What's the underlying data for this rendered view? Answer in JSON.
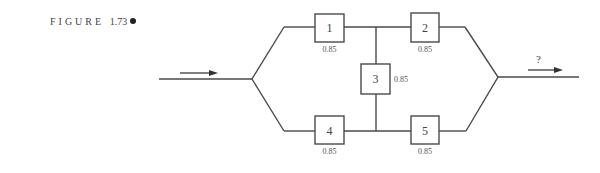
{
  "figure": {
    "label": "FIGURE",
    "number": "1.73",
    "marker": "bullet"
  },
  "diagram": {
    "type": "reliability-bridge-network",
    "input_arrow": "arrow-right",
    "output_arrow": "arrow-right",
    "output_label": "?",
    "components": [
      {
        "id": "1",
        "label": "1",
        "reliability": "0.85",
        "position": "top-left"
      },
      {
        "id": "2",
        "label": "2",
        "reliability": "0.85",
        "position": "top-right"
      },
      {
        "id": "3",
        "label": "3",
        "reliability": "0.85",
        "position": "bridge-center"
      },
      {
        "id": "4",
        "label": "4",
        "reliability": "0.85",
        "position": "bottom-left"
      },
      {
        "id": "5",
        "label": "5",
        "reliability": "0.85",
        "position": "bottom-right"
      }
    ]
  }
}
